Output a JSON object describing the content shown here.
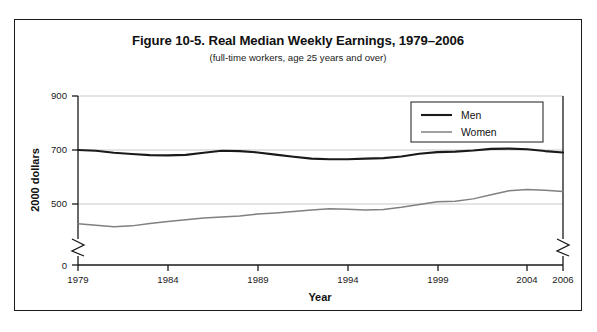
{
  "figure": {
    "title": "Figure 10-5. Real Median Weekly Earnings, 1979–2006",
    "subtitle": "(full-time workers, age 25 years and over)"
  },
  "axes": {
    "x_title": "Year",
    "y_title": "2000 dollars",
    "x_ticks": [
      "1979",
      "1984",
      "1989",
      "1994",
      "1999",
      "2004",
      "2006"
    ],
    "y_ticks": [
      "0",
      "500",
      "700",
      "900"
    ],
    "axis_break": "zigzag-break"
  },
  "legend": {
    "position": "top-right",
    "entries": [
      {
        "label": "Men",
        "color": "#1a1a1a"
      },
      {
        "label": "Women",
        "color": "#808080"
      }
    ]
  },
  "colors": {
    "men_line": "#1a1a1a",
    "women_line": "#808080",
    "gridline": "#c9c9c9",
    "axis": "#1a1a1a",
    "frame": "#1a1a1a",
    "background": "#ffffff"
  },
  "chart_data": {
    "type": "line",
    "title": "Figure 10-5. Real Median Weekly Earnings, 1979–2006",
    "subtitle": "(full-time workers, age 25 years and over)",
    "xlabel": "Year",
    "ylabel": "2000 dollars",
    "xlim": [
      1979,
      2006
    ],
    "ylim": [
      400,
      900
    ],
    "ylim_displayed": [
      0,
      900
    ],
    "y_ticks": [
      0,
      500,
      700,
      900
    ],
    "x_ticks": [
      1979,
      1984,
      1989,
      1994,
      1999,
      2004,
      2006
    ],
    "grid": "horizontal gridlines at 500, 700, 900",
    "axis_break": true,
    "legend_position": "top-right",
    "x": [
      1979,
      1980,
      1981,
      1982,
      1983,
      1984,
      1985,
      1986,
      1987,
      1988,
      1989,
      1990,
      1991,
      1992,
      1993,
      1994,
      1995,
      1996,
      1997,
      1998,
      1999,
      2000,
      2001,
      2002,
      2003,
      2004,
      2005,
      2006
    ],
    "series": [
      {
        "name": "Men",
        "color": "#1a1a1a",
        "values": [
          700,
          697,
          690,
          685,
          681,
          680,
          682,
          690,
          697,
          696,
          691,
          683,
          675,
          668,
          666,
          666,
          668,
          670,
          676,
          686,
          692,
          694,
          698,
          704,
          705,
          703,
          696,
          691
        ]
      },
      {
        "name": "Women",
        "color": "#808080",
        "values": [
          427,
          421,
          416,
          419,
          428,
          435,
          442,
          448,
          452,
          456,
          463,
          467,
          472,
          478,
          482,
          481,
          478,
          480,
          488,
          498,
          508,
          510,
          519,
          534,
          549,
          554,
          551,
          546
        ]
      }
    ]
  }
}
